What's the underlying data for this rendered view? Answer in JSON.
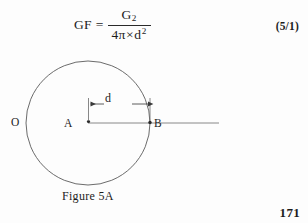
{
  "equation": {
    "lhs": "GF",
    "equals": "=",
    "numerator_base": "G",
    "numerator_sub": "2",
    "denominator_coefficient": "4",
    "denominator_pi": "π",
    "denominator_times": "×",
    "denominator_variable": "d",
    "denominator_exponent": "2",
    "number": "(5/1)"
  },
  "figure": {
    "caption": "Figure 5A",
    "labels": {
      "circle": "O",
      "center": "A",
      "circumference_point": "B",
      "distance": "d"
    },
    "geometry": {
      "circle_center_x": 88,
      "circle_center_y": 123,
      "circle_radius": 62,
      "point_a_x": 88,
      "point_a_y": 123,
      "point_b_x": 150,
      "point_b_y": 123,
      "axis_line_end_x": 219,
      "dimension_line_y": 104
    },
    "colors": {
      "stroke": "#555555",
      "text": "#232323",
      "background": "#fdfdfd"
    }
  },
  "page_number": "171"
}
